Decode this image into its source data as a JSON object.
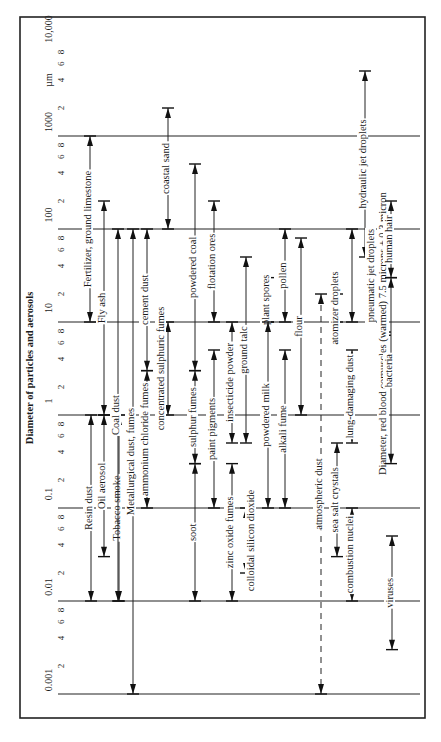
{
  "figure": {
    "axis_title": "Diameter of particles and aerosols",
    "unit": "µm",
    "scale": "log",
    "decades": [
      {
        "value": 0.001,
        "label": "0.001"
      },
      {
        "value": 0.01,
        "label": "0.01"
      },
      {
        "value": 0.1,
        "label": "0.1"
      },
      {
        "value": 1,
        "label": "1"
      },
      {
        "value": 10,
        "label": "10"
      },
      {
        "value": 100,
        "label": "100"
      },
      {
        "value": 1000,
        "label": "1000"
      },
      {
        "value": 10000,
        "label": "10,000"
      }
    ],
    "minor_ticks": [
      "2",
      "4",
      "6",
      "8"
    ]
  },
  "chart_data": {
    "type": "range-diagram",
    "title": "Diameter of particles and aerosols",
    "axis_label": "Diameter of particles and aerosols (µm)",
    "axis_range": [
      0.001,
      10000
    ],
    "scale": "log",
    "items": [
      {
        "name": "Fertilizer, ground limestone",
        "min": 10,
        "max": 1000
      },
      {
        "name": "Fly ash",
        "min": 1,
        "max": 200
      },
      {
        "name": "Resin dust",
        "min": 0.01,
        "max": 1
      },
      {
        "name": "Oil aerosol",
        "min": 0.03,
        "max": 1
      },
      {
        "name": "Tobacco smoke",
        "min": 0.01,
        "max": 1
      },
      {
        "name": "Coal dust",
        "min": 0.01,
        "max": 100
      },
      {
        "name": "Metallurgical dust, fumes",
        "min": 0.001,
        "max": 100
      },
      {
        "name": "cement dust",
        "min": 3,
        "max": 100
      },
      {
        "name": "ammonium chloride fumes",
        "min": 0.1,
        "max": 3
      },
      {
        "name": "coastal sand",
        "min": 100,
        "max": 2000
      },
      {
        "name": "concentrated sulphuric fumes",
        "min": 1,
        "max": 10
      },
      {
        "name": "powdered coal",
        "min": 3,
        "max": 500
      },
      {
        "name": "sulphur fumes",
        "min": 0.3,
        "max": 3
      },
      {
        "name": "soot",
        "min": 0.01,
        "max": 0.3
      },
      {
        "name": "flotation ores",
        "min": 10,
        "max": 200
      },
      {
        "name": "paint pigments",
        "min": 0.1,
        "max": 5
      },
      {
        "name": "insecticide powder",
        "min": 0.5,
        "max": 10
      },
      {
        "name": "zinc oxide fumes",
        "min": 0.01,
        "max": 0.3
      },
      {
        "name": "ground talc",
        "min": 0.5,
        "max": 50
      },
      {
        "name": "colloidal silicon dioxide",
        "min": 0.02,
        "max": 0.1
      },
      {
        "name": "plant spores",
        "min": 10,
        "max": 30
      },
      {
        "name": "powdered milk",
        "min": 0.1,
        "max": 10
      },
      {
        "name": "pollen",
        "min": 10,
        "max": 100
      },
      {
        "name": "alkali fume",
        "min": 0.1,
        "max": 5
      },
      {
        "name": "flour",
        "min": 1,
        "max": 80
      },
      {
        "name": "atmospheric dust",
        "min": 0.001,
        "max": 20
      },
      {
        "name": "sea salt crystals",
        "min": 0.03,
        "max": 0.5
      },
      {
        "name": "atomizer droplets",
        "min": 10,
        "max": 20
      },
      {
        "name": "lung-damaging dust",
        "min": 0.5,
        "max": 5
      },
      {
        "name": "combustion nuclei",
        "min": 0.01,
        "max": 0.1
      },
      {
        "name": "hydraulic jet droplets",
        "min": 50,
        "max": 5000
      },
      {
        "name": "pneumatic jet droplets",
        "min": 10,
        "max": 100
      },
      {
        "name": "Diameter, red blood corpuscles (warmed) 7.5 microns ± 0.3 micron",
        "min": 7.2,
        "max": 7.8
      },
      {
        "name": "human hair",
        "min": 30,
        "max": 200
      },
      {
        "name": "bacteria",
        "min": 0.3,
        "max": 30
      },
      {
        "name": "viruses",
        "min": 0.003,
        "max": 0.05
      }
    ]
  }
}
